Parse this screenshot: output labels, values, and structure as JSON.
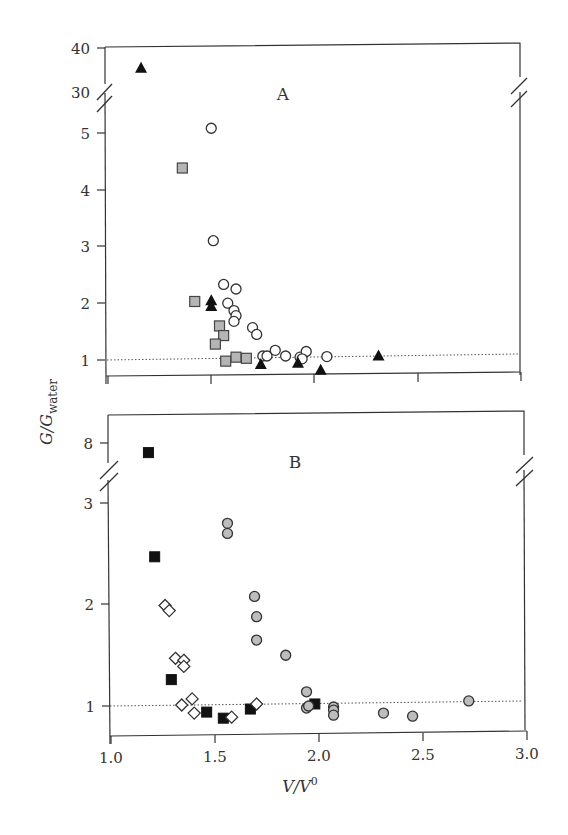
{
  "chart_data": [
    {
      "panel": "A",
      "type": "scatter",
      "title": "",
      "panel_label": "A",
      "xlabel": "V/V0",
      "ylabel": "G/G_water",
      "xlim": [
        1.0,
        3.0
      ],
      "ylim_lower": [
        0.7,
        5.4
      ],
      "ylim_upper": [
        30,
        40
      ],
      "y_break": true,
      "y_ticks_lower": [
        1,
        2,
        3,
        4,
        5
      ],
      "y_ticks_upper": [
        30,
        40
      ],
      "x_ticks": [
        1.0,
        1.5,
        2.0,
        2.5,
        3.0
      ],
      "x_tick_labels_shown": false,
      "reference_line": {
        "y": 1.0,
        "style": "dotted"
      },
      "grid": false,
      "series": [
        {
          "name": "open circles",
          "marker": "circle-open",
          "points": [
            [
              1.5,
              5.08
            ],
            [
              1.51,
              3.1
            ],
            [
              1.56,
              2.33
            ],
            [
              1.62,
              2.25
            ],
            [
              1.58,
              2.0
            ],
            [
              1.61,
              1.87
            ],
            [
              1.62,
              1.78
            ],
            [
              1.61,
              1.68
            ],
            [
              1.7,
              1.57
            ],
            [
              1.72,
              1.45
            ],
            [
              1.75,
              1.07
            ],
            [
              1.77,
              1.07
            ],
            [
              1.81,
              1.17
            ],
            [
              1.86,
              1.07
            ],
            [
              1.93,
              1.05
            ],
            [
              1.96,
              1.15
            ],
            [
              2.06,
              1.06
            ],
            [
              1.94,
              1.02
            ]
          ]
        },
        {
          "name": "grey squares",
          "marker": "square-grey",
          "points": [
            [
              1.36,
              4.38
            ],
            [
              1.42,
              2.03
            ],
            [
              1.54,
              1.6
            ],
            [
              1.56,
              1.43
            ],
            [
              1.52,
              1.28
            ],
            [
              1.57,
              0.98
            ],
            [
              1.62,
              1.05
            ],
            [
              1.67,
              1.03
            ]
          ]
        },
        {
          "name": "filled triangles",
          "marker": "triangle-filled",
          "points": [
            [
              1.16,
              35.5
            ],
            [
              1.5,
              2.05
            ],
            [
              1.5,
              1.95
            ],
            [
              1.74,
              0.93
            ],
            [
              1.92,
              0.95
            ],
            [
              2.03,
              0.83
            ],
            [
              2.31,
              1.08
            ]
          ]
        }
      ]
    },
    {
      "panel": "B",
      "type": "scatter",
      "title": "",
      "panel_label": "B",
      "xlabel": "V/V0",
      "ylabel": "G/G_water",
      "xlim": [
        1.0,
        3.0
      ],
      "ylim_lower": [
        0.7,
        3.3
      ],
      "ylim_upper": [
        8,
        8
      ],
      "y_break": true,
      "y_ticks_lower": [
        1,
        2,
        3
      ],
      "y_ticks_upper": [
        8
      ],
      "x_ticks": [
        1.0,
        1.5,
        2.0,
        2.5,
        3.0
      ],
      "x_tick_labels": [
        "1.0",
        "1.5",
        "2.0",
        "2.5",
        "3.0"
      ],
      "reference_line": {
        "y": 1.0,
        "style": "dotted"
      },
      "grid": false,
      "series": [
        {
          "name": "filled squares",
          "marker": "square-filled",
          "points": [
            [
              1.18,
              7.2
            ],
            [
              1.21,
              2.47
            ],
            [
              1.29,
              1.26
            ],
            [
              1.46,
              0.94
            ],
            [
              1.54,
              0.88
            ],
            [
              1.67,
              0.97
            ],
            [
              1.98,
              1.02
            ]
          ]
        },
        {
          "name": "open diamonds",
          "marker": "diamond-open",
          "points": [
            [
              1.26,
              1.99
            ],
            [
              1.28,
              1.94
            ],
            [
              1.31,
              1.47
            ],
            [
              1.35,
              1.45
            ],
            [
              1.35,
              1.39
            ],
            [
              1.34,
              1.01
            ],
            [
              1.39,
              1.07
            ],
            [
              1.4,
              0.93
            ],
            [
              1.58,
              0.89
            ],
            [
              1.7,
              1.02
            ]
          ]
        },
        {
          "name": "grey circles",
          "marker": "circle-grey",
          "points": [
            [
              1.56,
              2.8
            ],
            [
              1.56,
              2.7
            ],
            [
              1.69,
              2.08
            ],
            [
              1.7,
              1.88
            ],
            [
              1.7,
              1.65
            ],
            [
              1.84,
              1.5
            ],
            [
              1.94,
              1.14
            ],
            [
              1.94,
              0.98
            ],
            [
              1.95,
              1.0
            ],
            [
              2.07,
              0.99
            ],
            [
              2.07,
              0.96
            ],
            [
              2.07,
              0.91
            ],
            [
              2.31,
              0.93
            ],
            [
              2.45,
              0.9
            ],
            [
              2.72,
              1.05
            ]
          ]
        }
      ]
    }
  ],
  "labels": {
    "panel_a": "A",
    "panel_b": "B",
    "ylabel_main": "G/G",
    "ylabel_sub": "water",
    "xlabel_main": "V/V",
    "xlabel_sup": "0",
    "a_ticks": {
      "t40": "40",
      "t30": "30",
      "t5": "5",
      "t4": "4",
      "t3": "3",
      "t2": "2",
      "t1": "1"
    },
    "b_ticks": {
      "t8": "8",
      "t3": "3",
      "t2": "2",
      "t1": "1"
    },
    "x_ticks": {
      "x10": "1.0",
      "x15": "1.5",
      "x20": "2.0",
      "x25": "2.5",
      "x30": "3.0"
    }
  }
}
